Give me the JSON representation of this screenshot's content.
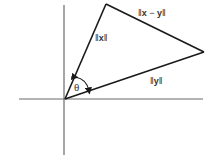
{
  "diagram": {
    "colors": {
      "axis": "#6b6b6b",
      "vector": "#1a1a1a",
      "text": "#333333",
      "background": "#ffffff"
    },
    "origin": [
      65,
      99
    ],
    "axes": {
      "horizontal": {
        "x1": 19,
        "x2": 203,
        "y": 99
      },
      "vertical": {
        "x": 64,
        "y1": 5,
        "y2": 155
      }
    },
    "vectors": {
      "x": {
        "tip": [
          106,
          4
        ]
      },
      "y": {
        "tip": [
          204,
          52
        ]
      }
    },
    "labels": {
      "norm_x": {
        "open": "‖",
        "var": "x",
        "close": "‖"
      },
      "norm_x_minus_y": {
        "open": "‖",
        "var1": "x",
        "op": " − ",
        "var2": "y",
        "close": "‖"
      },
      "norm_y": {
        "open": "‖",
        "var": "y",
        "close": "‖"
      },
      "angle": "θ"
    }
  }
}
